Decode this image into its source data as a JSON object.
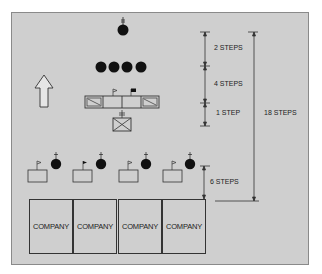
{
  "diagram": {
    "type": "troop-formation",
    "direction_of_march": "up",
    "measurements": [
      {
        "label": "2 STEPS",
        "between": "commander to staff/guidon line"
      },
      {
        "label": "4 STEPS",
        "between": "staff line to color guard"
      },
      {
        "label": "1 STEP",
        "between": "color guard to band/unit behind"
      },
      {
        "label": "18 STEPS",
        "between": "commander to front of companies"
      },
      {
        "label": "6 STEPS",
        "between": "company commanders/guidons to companies"
      }
    ],
    "companies": [
      {
        "label": "COMPANY"
      },
      {
        "label": "COMPANY"
      },
      {
        "label": "COMPANY"
      },
      {
        "label": "COMPANY"
      }
    ],
    "symbols": {
      "commander": "filled-circle-with-rank",
      "staff": "filled-circles x4",
      "color_guard": "box row with flags and rifle guards",
      "unit_behind_colors": "crossed box (infantry) with rank",
      "company_guidons": "guidon boxes with flags x4",
      "company_commanders": "filled circles with rank x4"
    },
    "colors": {
      "background": "#cfcfcf",
      "line": "#333333",
      "symbol_fill": "#111111"
    }
  }
}
